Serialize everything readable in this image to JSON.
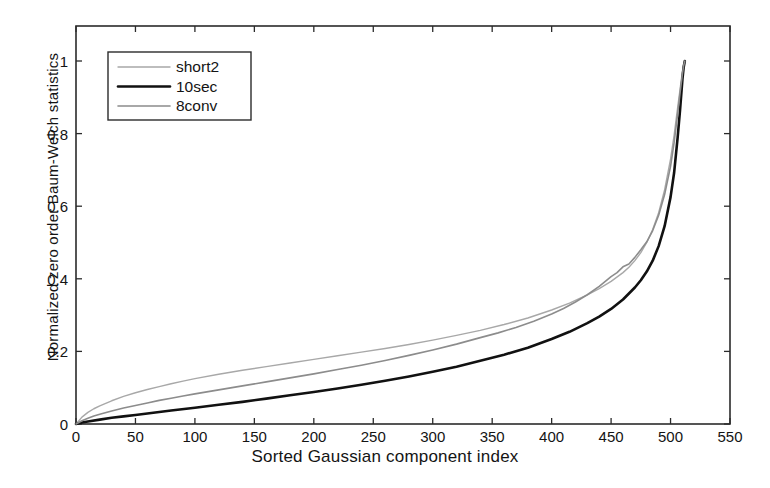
{
  "chart_data": {
    "type": "line",
    "title": "",
    "xlabel": "Sorted Gaussian component index",
    "ylabel": "Normalized zero order Baum-Welch statistics",
    "xlim": [
      0,
      550
    ],
    "ylim": [
      0,
      1.08
    ],
    "xticks": [
      0,
      50,
      100,
      150,
      200,
      250,
      300,
      350,
      400,
      450,
      500,
      550
    ],
    "yticks": [
      0,
      0.2,
      0.4,
      0.6,
      0.8,
      1
    ],
    "xtick_labels": [
      "0",
      "50",
      "100",
      "150",
      "200",
      "250",
      "300",
      "350",
      "400",
      "450",
      "500",
      "550"
    ],
    "ytick_labels": [
      "0",
      "0.2",
      "0.4",
      "0.6",
      "0.8",
      "1"
    ],
    "grid": false,
    "legend_position": "upper left",
    "legend_entries": [
      "short2",
      "10sec",
      "8conv"
    ],
    "series": [
      {
        "name": "short2",
        "color": "#a8a8a8",
        "width": 1.4,
        "x": [
          0,
          5,
          10,
          15,
          20,
          30,
          40,
          50,
          60,
          70,
          80,
          90,
          100,
          120,
          140,
          160,
          180,
          200,
          220,
          240,
          260,
          280,
          300,
          320,
          340,
          360,
          380,
          400,
          415,
          430,
          440,
          450,
          460,
          465,
          470,
          475,
          480,
          485,
          490,
          495,
          500,
          503,
          506,
          508,
          510,
          511,
          512
        ],
        "y": [
          0.0,
          0.019,
          0.032,
          0.042,
          0.05,
          0.064,
          0.076,
          0.086,
          0.095,
          0.103,
          0.111,
          0.118,
          0.125,
          0.137,
          0.148,
          0.158,
          0.168,
          0.178,
          0.188,
          0.198,
          0.208,
          0.219,
          0.231,
          0.244,
          0.258,
          0.274,
          0.292,
          0.314,
          0.333,
          0.356,
          0.373,
          0.393,
          0.417,
          0.432,
          0.45,
          0.472,
          0.5,
          0.536,
          0.582,
          0.645,
          0.73,
          0.795,
          0.872,
          0.922,
          0.972,
          0.99,
          1.0
        ]
      },
      {
        "name": "10sec",
        "color": "#111111",
        "width": 2.6,
        "x": [
          0,
          5,
          10,
          20,
          30,
          40,
          50,
          60,
          80,
          100,
          120,
          140,
          160,
          180,
          200,
          220,
          240,
          260,
          280,
          300,
          320,
          340,
          360,
          380,
          400,
          415,
          430,
          440,
          450,
          460,
          470,
          475,
          480,
          485,
          490,
          495,
          500,
          503,
          506,
          508,
          510,
          511,
          512
        ],
        "y": [
          0.0,
          0.004,
          0.007,
          0.012,
          0.017,
          0.021,
          0.025,
          0.029,
          0.037,
          0.045,
          0.053,
          0.061,
          0.07,
          0.079,
          0.088,
          0.098,
          0.108,
          0.119,
          0.131,
          0.144,
          0.158,
          0.174,
          0.191,
          0.21,
          0.234,
          0.254,
          0.278,
          0.296,
          0.317,
          0.343,
          0.376,
          0.396,
          0.42,
          0.45,
          0.49,
          0.545,
          0.625,
          0.692,
          0.79,
          0.865,
          0.95,
          0.982,
          1.0
        ]
      },
      {
        "name": "8conv",
        "color": "#8c8c8c",
        "width": 1.6,
        "x": [
          0,
          5,
          10,
          15,
          20,
          30,
          40,
          50,
          60,
          70,
          80,
          90,
          100,
          120,
          140,
          160,
          180,
          200,
          220,
          240,
          260,
          280,
          300,
          320,
          340,
          355,
          370,
          385,
          400,
          410,
          420,
          430,
          440,
          450,
          455,
          460,
          465,
          470,
          475,
          480,
          485,
          490,
          495,
          500,
          503,
          506,
          508,
          510,
          511,
          512
        ],
        "y": [
          0.0,
          0.009,
          0.016,
          0.022,
          0.027,
          0.036,
          0.044,
          0.051,
          0.058,
          0.065,
          0.071,
          0.077,
          0.083,
          0.094,
          0.105,
          0.116,
          0.127,
          0.138,
          0.15,
          0.162,
          0.175,
          0.189,
          0.204,
          0.22,
          0.238,
          0.251,
          0.266,
          0.283,
          0.303,
          0.318,
          0.336,
          0.356,
          0.379,
          0.406,
          0.417,
          0.433,
          0.441,
          0.459,
          0.48,
          0.502,
          0.533,
          0.575,
          0.632,
          0.71,
          0.775,
          0.855,
          0.912,
          0.965,
          0.987,
          1.0
        ]
      }
    ]
  },
  "legend": {
    "items": [
      {
        "label": "short2",
        "color": "#a8a8a8",
        "width": 1.4
      },
      {
        "label": "10sec",
        "color": "#111111",
        "width": 2.6
      },
      {
        "label": "8conv",
        "color": "#8c8c8c",
        "width": 1.6
      }
    ]
  },
  "colors": {
    "axis": "#2b2b2b",
    "text": "#141414",
    "background": "#ffffff"
  }
}
